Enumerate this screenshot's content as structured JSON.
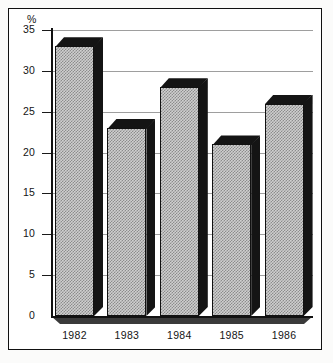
{
  "chart_data": {
    "type": "bar",
    "title": "",
    "subtitle": "",
    "xlabel": "",
    "ylabel": "%",
    "unit_label": "%",
    "categories": [
      "1982",
      "1983",
      "1984",
      "1985",
      "1986"
    ],
    "values": [
      33,
      23,
      28,
      21,
      26
    ],
    "ylim": [
      0,
      35
    ],
    "ytick_labels": [
      "35",
      "30",
      "25",
      "20",
      "15",
      "10",
      "5",
      "0"
    ],
    "ytick_values": [
      35,
      30,
      25,
      20,
      15,
      10,
      5,
      0
    ],
    "grid": true,
    "legend": null,
    "series": [
      {
        "name": "",
        "values": [
          33,
          23,
          28,
          21,
          26
        ]
      }
    ],
    "style": {
      "bar_fill": "#cfcfcf",
      "bar_pattern": "dithered-checker",
      "bar_shadow": "#141414",
      "axis_color": "#111111",
      "grid_color": "#8d8d8d",
      "background": "#ffffff",
      "frame_color": "#111111"
    }
  }
}
